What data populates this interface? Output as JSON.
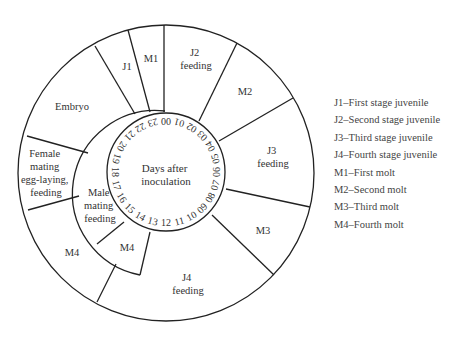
{
  "diagram": {
    "center_label": [
      "Days after",
      "inoculation"
    ],
    "days": [
      "00",
      "01",
      "02",
      "03",
      "04",
      "05",
      "06",
      "07",
      "08",
      "09",
      "10",
      "11",
      "12",
      "13",
      "14",
      "15",
      "16",
      "17",
      "18",
      "19",
      "20",
      "21",
      "22",
      "23"
    ],
    "outer_segments": [
      {
        "id": "embryo",
        "lines": [
          "Embryo"
        ]
      },
      {
        "id": "j1",
        "lines": [
          "J1"
        ]
      },
      {
        "id": "m1",
        "lines": [
          "M1"
        ]
      },
      {
        "id": "j2",
        "lines": [
          "J2",
          "feeding"
        ]
      },
      {
        "id": "m2",
        "lines": [
          "M2"
        ]
      },
      {
        "id": "j3",
        "lines": [
          "J3",
          "feeding"
        ]
      },
      {
        "id": "m3",
        "lines": [
          "M3"
        ]
      },
      {
        "id": "j4",
        "lines": [
          "J4",
          "feeding"
        ]
      },
      {
        "id": "m4-female",
        "lines": [
          "M4"
        ]
      },
      {
        "id": "female",
        "lines": [
          "Female",
          "mating",
          "egg-laying,",
          "feeding"
        ]
      }
    ],
    "male_segments": [
      {
        "id": "male",
        "lines": [
          "Male",
          "mating",
          "feeding"
        ]
      },
      {
        "id": "m4-male",
        "lines": [
          "M4"
        ]
      }
    ]
  },
  "legend": [
    "J1–First stage juvenile",
    "J2–Second stage juvenile",
    "J3–Third stage juvenile",
    "J4–Fourth stage juvenile",
    "M1–First molt",
    "M2–Second molt",
    "M3–Third molt",
    "M4–Fourth molt"
  ]
}
